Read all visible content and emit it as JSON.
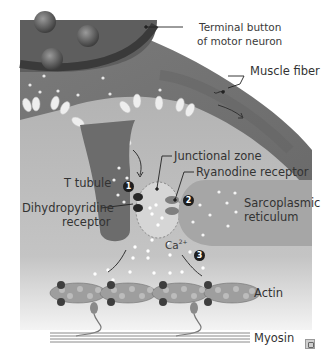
{
  "diagram": {
    "type": "neuromuscular excitation-contraction coupling",
    "labels": {
      "terminal_button_line1": "Terminal button",
      "terminal_button_line2": "of motor neuron",
      "muscle_fiber": "Muscle fiber",
      "junctional_zone": "Junctional zone",
      "ryanodine_receptor": "Ryanodine receptor",
      "t_tubule": "T tubule",
      "dihydropyridine_line1": "Dihydropyridine",
      "dihydropyridine_line2": "receptor",
      "sarcoplasmic_line1": "Sarcoplasmic",
      "sarcoplasmic_line2": "reticulum",
      "calcium": "Ca",
      "calcium_sup": "2+",
      "actin": "Actin",
      "myosin": "Myosin"
    },
    "steps": [
      "1",
      "2",
      "3"
    ],
    "colors": {
      "neuron": "#5f5f5f",
      "muscle_fiber": "#7a7a7a",
      "cytoplasm": "#b9b9b9",
      "t_tubule": "#6e6e6e",
      "reticulum": "#a8a8a8",
      "receptor_dark": "#262626",
      "ion": "#ffffff",
      "background": "#ffffff"
    }
  },
  "corner_icon": "expand-icon"
}
